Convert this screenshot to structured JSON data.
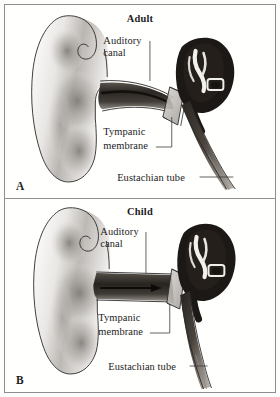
{
  "figure": {
    "title_visible": false,
    "border_color": "#8e8e8e",
    "background_color": "#fffffe",
    "ink_color": "#1c1c1c"
  },
  "panels": [
    {
      "id": "A",
      "panel_label": "A",
      "title": "Adult",
      "labels": {
        "auditory_canal_line1": "Auditory",
        "auditory_canal_line2": "canal",
        "tympanic_membrane_line1": "Tympanic",
        "tympanic_membrane_line2": "membrane",
        "eustachian_tube": "Eustachian tube"
      },
      "icons": {
        "pinna": "outer-ear-pinna",
        "canal": "auditory-canal",
        "eardrum": "tympanic-membrane",
        "middle_ear": "middle-ear-mass",
        "tube": "eustachian-tube"
      }
    },
    {
      "id": "B",
      "panel_label": "B",
      "title": "Child",
      "labels": {
        "auditory_canal_line1": "Auditory",
        "auditory_canal_line2": "canal",
        "tympanic_membrane_line1": "Tympanic",
        "tympanic_membrane_line2": "membrane",
        "eustachian_tube": "Eustachian tube"
      },
      "icons": {
        "pinna": "outer-ear-pinna",
        "canal": "auditory-canal",
        "eardrum": "tympanic-membrane",
        "middle_ear": "middle-ear-mass",
        "tube": "eustachian-tube",
        "canal_arrow": "straight-canal-arrow"
      }
    }
  ]
}
